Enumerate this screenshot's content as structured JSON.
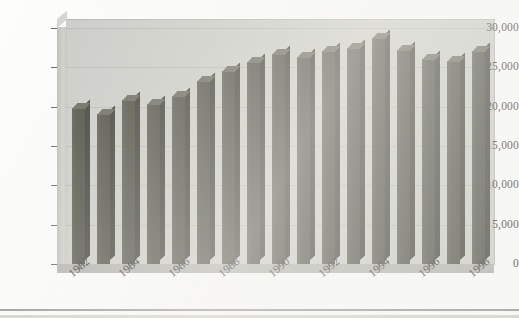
{
  "chart_data": {
    "type": "bar",
    "title": "",
    "subtitle": "",
    "xlabel": "",
    "ylabel": "",
    "categories": [
      "1982",
      "1983",
      "1984",
      "1985",
      "1986",
      "1987",
      "1988",
      "1989",
      "1990",
      "1991",
      "1992",
      "1993",
      "1994",
      "1995",
      "1996",
      "1997",
      "1998"
    ],
    "values": [
      19800,
      19100,
      20800,
      20400,
      21400,
      23300,
      24500,
      25700,
      26700,
      26300,
      27100,
      27400,
      28700,
      27200,
      26100,
      25800,
      27100
    ],
    "ylim": [
      0,
      30000
    ],
    "ytick_values": [
      0,
      5000,
      10000,
      15000,
      20000,
      25000,
      30000
    ],
    "ytick_labels": [
      "0",
      "5,000",
      "10,000",
      "15,000",
      "20,000",
      "25,000",
      "30,000"
    ],
    "xtick_labels_shown": [
      "1982",
      "1984",
      "1986",
      "1988",
      "1990",
      "1992",
      "1994",
      "1996",
      "1998"
    ],
    "grid": true,
    "grid_axis": "y",
    "legend": false,
    "legend_position": "none",
    "style": "3d-column",
    "bar_color": "#45443a",
    "plot_background": "#c9c9c5",
    "page_background": "#fdfdfc",
    "axis_text_color": "#232323"
  },
  "figure": {
    "axis_tick_color": "#5a5a57",
    "gridline_color": "#a0a09b"
  }
}
